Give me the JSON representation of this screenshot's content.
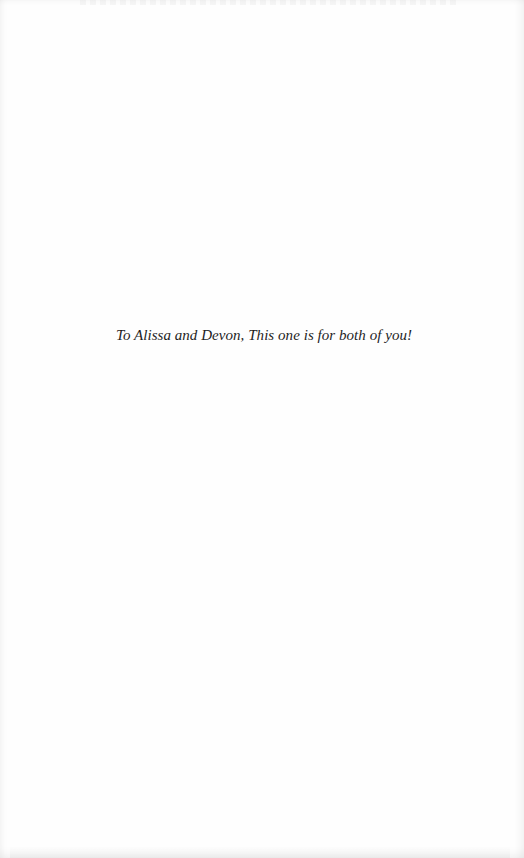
{
  "page": {
    "type": "dedication",
    "background_color": "#fefefe",
    "text_color": "#1e1e1e"
  },
  "dedication": {
    "text": "To Alissa and Devon, This one is for both of you!"
  }
}
